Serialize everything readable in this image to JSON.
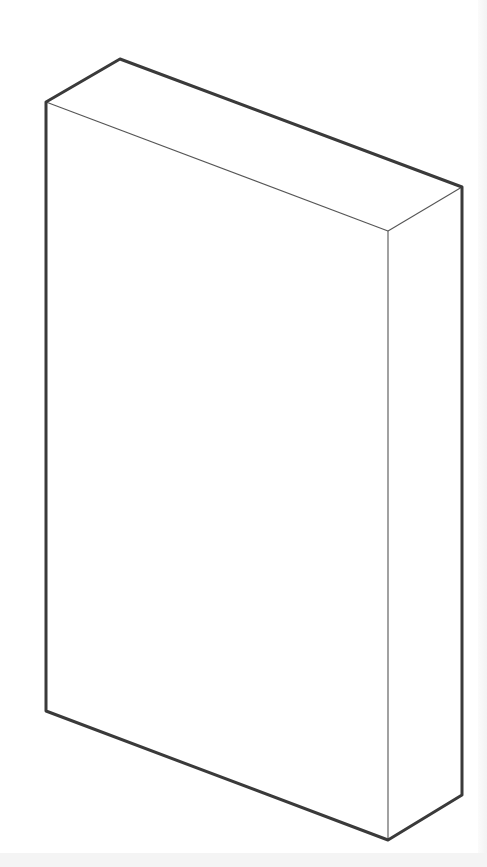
{
  "diagram": {
    "type": "isometric-box",
    "colors": {
      "outline": "#3a3a3a",
      "inner_edge": "#555555",
      "fill": "#ffffff",
      "background": "#ffffff"
    },
    "vertices": {
      "top_back_left": [
        120,
        59
      ],
      "top_front_left": [
        46,
        102
      ],
      "top_back_right": [
        462,
        187
      ],
      "top_front_right": [
        388,
        231
      ],
      "bottom_front_left": [
        46,
        711
      ],
      "bottom_front_right": [
        388,
        840
      ],
      "bottom_back_right": [
        462,
        795
      ]
    }
  }
}
